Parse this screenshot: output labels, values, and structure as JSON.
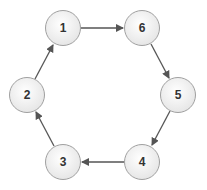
{
  "diagram": {
    "type": "directed-cycle",
    "nodes": [
      {
        "id": "1",
        "label": "1",
        "cx": 63,
        "cy": 28
      },
      {
        "id": "6",
        "label": "6",
        "cx": 142,
        "cy": 28
      },
      {
        "id": "5",
        "label": "5",
        "cx": 178,
        "cy": 95
      },
      {
        "id": "4",
        "label": "4",
        "cx": 142,
        "cy": 162
      },
      {
        "id": "3",
        "label": "3",
        "cx": 63,
        "cy": 162
      },
      {
        "id": "2",
        "label": "2",
        "cx": 27,
        "cy": 95
      }
    ],
    "edges": [
      {
        "from": "1",
        "to": "6"
      },
      {
        "from": "6",
        "to": "5"
      },
      {
        "from": "5",
        "to": "4"
      },
      {
        "from": "4",
        "to": "3"
      },
      {
        "from": "3",
        "to": "2"
      },
      {
        "from": "2",
        "to": "1"
      }
    ],
    "colors": {
      "node_fill_top": "#ffffff",
      "node_fill_bottom": "#e6e6e6",
      "node_stroke": "#a0a0a0",
      "edge": "#555555",
      "label": "#333333"
    }
  }
}
